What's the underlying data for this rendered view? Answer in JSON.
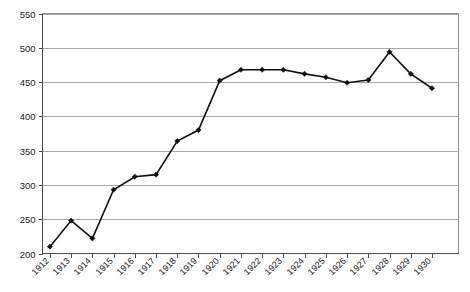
{
  "chart_data": {
    "type": "line",
    "title": "",
    "subtitle": "",
    "xlabel": "",
    "ylabel": "",
    "categories": [
      "1912",
      "1913",
      "1914",
      "1915",
      "1916",
      "1917",
      "1918",
      "1919",
      "1920",
      "1921",
      "1922",
      "1923",
      "1924",
      "1925",
      "1926",
      "1927",
      "1928",
      "1929",
      "1930"
    ],
    "values": [
      210,
      248,
      222,
      293,
      312,
      315,
      364,
      380,
      452,
      468,
      468,
      468,
      462,
      457,
      449,
      453,
      494,
      462,
      441
    ],
    "series": [
      {
        "name": "",
        "values": [
          210,
          248,
          222,
          293,
          312,
          315,
          364,
          380,
          452,
          468,
          468,
          468,
          462,
          457,
          449,
          453,
          494,
          462,
          441
        ]
      }
    ],
    "ylim": [
      200,
      550
    ],
    "yticks": [
      200,
      250,
      300,
      350,
      400,
      450,
      500,
      550
    ],
    "ytick_labels": [
      "200",
      "250",
      "300",
      "350",
      "400",
      "450",
      "500",
      "550"
    ],
    "xtick_labels": [
      "1912",
      "1913",
      "1914",
      "1915",
      "1916",
      "1917",
      "1918",
      "1919",
      "1920",
      "1921",
      "1922",
      "1923",
      "1924",
      "1925",
      "1926",
      "1927",
      "1928",
      "1929",
      "1930"
    ],
    "xtick_rotation_deg": -45,
    "grid": {
      "horizontal": true,
      "vertical": false
    },
    "legend": {
      "visible": false,
      "position": "none"
    },
    "marker": "diamond",
    "colors": {
      "line": "#111111",
      "marker": "#111111",
      "gridline": "#a8a8a8",
      "axis": "#4a4a4a",
      "frame": "#8c8c8c",
      "background": "#ffffff",
      "text": "#1a1a1a"
    },
    "annotations": []
  }
}
